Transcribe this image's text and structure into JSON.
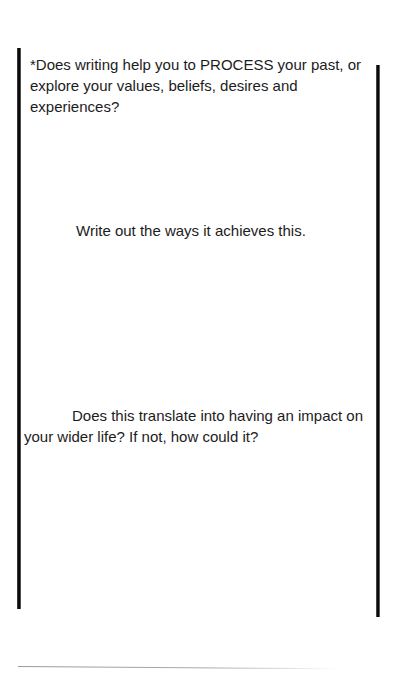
{
  "document": {
    "prompts": [
      {
        "id": "process",
        "text": "*Does writing help you to PROCESS your past, or explore your values, beliefs, desires and experiences?"
      },
      {
        "id": "ways",
        "text": "Write out the ways it achieves this."
      },
      {
        "id": "impact",
        "text": "Does this translate into having an impact on your wider life? If not, how could it?"
      }
    ]
  },
  "colors": {
    "background": "#ffffff",
    "text": "#1c1c1c",
    "border": "#000000"
  }
}
